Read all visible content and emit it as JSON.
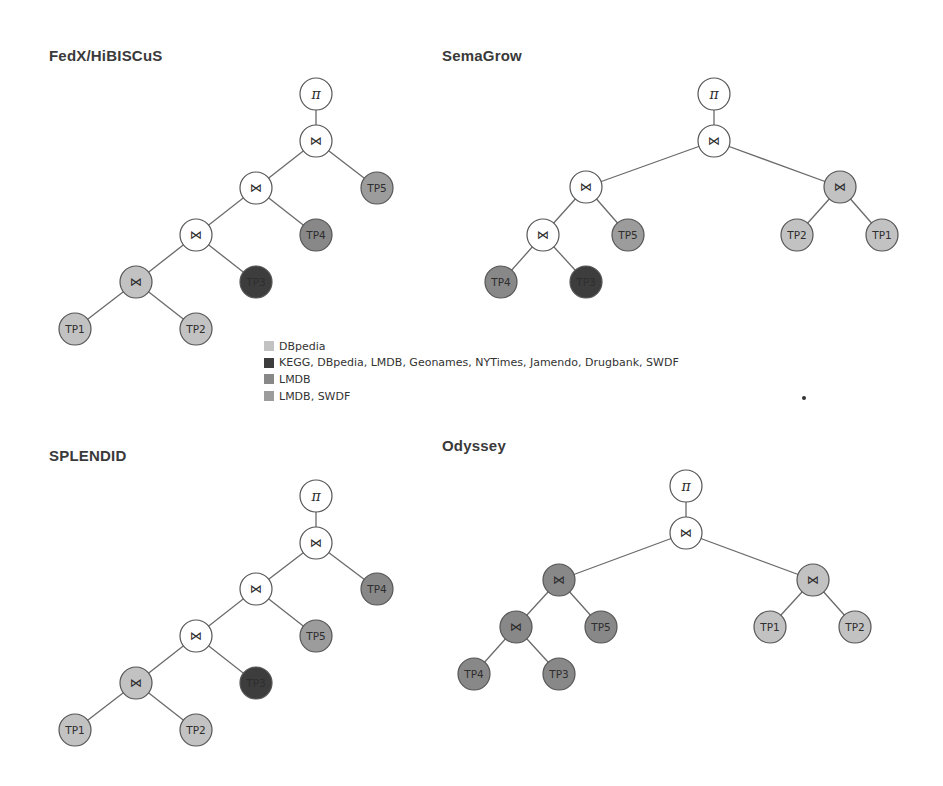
{
  "colors": {
    "dbpedia": "#c2c2c2",
    "all_sources": "#3d3d3d",
    "lmdb": "#888888",
    "lmdb_swdf": "#9c9c9c",
    "operator_white": "#ffffff"
  },
  "node_radius": 16,
  "panels": [
    {
      "id": "fedx",
      "title": "FedX/HiBISCuS",
      "title_pos": [
        49,
        56
      ],
      "nodes": [
        {
          "id": "pi",
          "label": "π",
          "kind": "pi",
          "x": 316,
          "y": 94,
          "color": "operator_white"
        },
        {
          "id": "j1",
          "label": "⋈",
          "kind": "op",
          "x": 316,
          "y": 141,
          "color": "operator_white"
        },
        {
          "id": "j2",
          "label": "⋈",
          "kind": "op",
          "x": 256,
          "y": 188,
          "color": "operator_white"
        },
        {
          "id": "tp5",
          "label": "TP5",
          "kind": "tp",
          "x": 377,
          "y": 188,
          "color": "lmdb_swdf"
        },
        {
          "id": "j3",
          "label": "⋈",
          "kind": "op",
          "x": 196,
          "y": 235,
          "color": "operator_white"
        },
        {
          "id": "tp4",
          "label": "TP4",
          "kind": "tp",
          "x": 316,
          "y": 235,
          "color": "lmdb"
        },
        {
          "id": "j4",
          "label": "⋈",
          "kind": "op",
          "x": 136,
          "y": 282,
          "color": "dbpedia"
        },
        {
          "id": "tp3",
          "label": "TP3",
          "kind": "tp",
          "x": 256,
          "y": 282,
          "color": "all_sources"
        },
        {
          "id": "tp1",
          "label": "TP1",
          "kind": "tp",
          "x": 75,
          "y": 329,
          "color": "dbpedia"
        },
        {
          "id": "tp2",
          "label": "TP2",
          "kind": "tp",
          "x": 196,
          "y": 329,
          "color": "dbpedia"
        }
      ],
      "edges": [
        [
          "pi",
          "j1"
        ],
        [
          "j1",
          "j2"
        ],
        [
          "j1",
          "tp5"
        ],
        [
          "j2",
          "j3"
        ],
        [
          "j2",
          "tp4"
        ],
        [
          "j3",
          "j4"
        ],
        [
          "j3",
          "tp3"
        ],
        [
          "j4",
          "tp1"
        ],
        [
          "j4",
          "tp2"
        ]
      ]
    },
    {
      "id": "semagrow",
      "title": "SemaGrow",
      "title_pos": [
        442,
        56
      ],
      "nodes": [
        {
          "id": "pi",
          "label": "π",
          "kind": "pi",
          "x": 714,
          "y": 94,
          "color": "operator_white"
        },
        {
          "id": "j1",
          "label": "⋈",
          "kind": "op",
          "x": 714,
          "y": 141,
          "color": "operator_white"
        },
        {
          "id": "jl",
          "label": "⋈",
          "kind": "op",
          "x": 586,
          "y": 187,
          "color": "operator_white"
        },
        {
          "id": "jr",
          "label": "⋈",
          "kind": "op",
          "x": 840,
          "y": 187,
          "color": "dbpedia"
        },
        {
          "id": "jll",
          "label": "⋈",
          "kind": "op",
          "x": 543,
          "y": 235,
          "color": "operator_white"
        },
        {
          "id": "tp5",
          "label": "TP5",
          "kind": "tp",
          "x": 628,
          "y": 235,
          "color": "lmdb_swdf"
        },
        {
          "id": "tp2",
          "label": "TP2",
          "kind": "tp",
          "x": 797,
          "y": 235,
          "color": "dbpedia"
        },
        {
          "id": "tp1",
          "label": "TP1",
          "kind": "tp",
          "x": 882,
          "y": 235,
          "color": "dbpedia"
        },
        {
          "id": "tp4",
          "label": "TP4",
          "kind": "tp",
          "x": 501,
          "y": 282,
          "color": "lmdb"
        },
        {
          "id": "tp3",
          "label": "TP3",
          "kind": "tp",
          "x": 586,
          "y": 282,
          "color": "all_sources"
        }
      ],
      "edges": [
        [
          "pi",
          "j1"
        ],
        [
          "j1",
          "jl"
        ],
        [
          "j1",
          "jr"
        ],
        [
          "jl",
          "jll"
        ],
        [
          "jl",
          "tp5"
        ],
        [
          "jr",
          "tp2"
        ],
        [
          "jr",
          "tp1"
        ],
        [
          "jll",
          "tp4"
        ],
        [
          "jll",
          "tp3"
        ]
      ]
    },
    {
      "id": "splendid",
      "title": "SPLENDID",
      "title_pos": [
        49,
        456
      ],
      "nodes": [
        {
          "id": "pi",
          "label": "π",
          "kind": "pi",
          "x": 316,
          "y": 496,
          "color": "operator_white"
        },
        {
          "id": "j1",
          "label": "⋈",
          "kind": "op",
          "x": 316,
          "y": 543,
          "color": "operator_white"
        },
        {
          "id": "j2",
          "label": "⋈",
          "kind": "op",
          "x": 256,
          "y": 589,
          "color": "operator_white"
        },
        {
          "id": "tp4",
          "label": "TP4",
          "kind": "tp",
          "x": 377,
          "y": 589,
          "color": "lmdb"
        },
        {
          "id": "j3",
          "label": "⋈",
          "kind": "op",
          "x": 196,
          "y": 636,
          "color": "operator_white"
        },
        {
          "id": "tp5",
          "label": "TP5",
          "kind": "tp",
          "x": 316,
          "y": 636,
          "color": "lmdb_swdf"
        },
        {
          "id": "j4",
          "label": "⋈",
          "kind": "op",
          "x": 136,
          "y": 683,
          "color": "dbpedia"
        },
        {
          "id": "tp3",
          "label": "TP3",
          "kind": "tp",
          "x": 256,
          "y": 683,
          "color": "all_sources"
        },
        {
          "id": "tp1",
          "label": "TP1",
          "kind": "tp",
          "x": 75,
          "y": 730,
          "color": "dbpedia"
        },
        {
          "id": "tp2",
          "label": "TP2",
          "kind": "tp",
          "x": 196,
          "y": 730,
          "color": "dbpedia"
        }
      ],
      "edges": [
        [
          "pi",
          "j1"
        ],
        [
          "j1",
          "j2"
        ],
        [
          "j1",
          "tp4"
        ],
        [
          "j2",
          "j3"
        ],
        [
          "j2",
          "tp5"
        ],
        [
          "j3",
          "j4"
        ],
        [
          "j3",
          "tp3"
        ],
        [
          "j4",
          "tp1"
        ],
        [
          "j4",
          "tp2"
        ]
      ]
    },
    {
      "id": "odyssey",
      "title": "Odyssey",
      "title_pos": [
        442,
        446
      ],
      "nodes": [
        {
          "id": "pi",
          "label": "π",
          "kind": "pi",
          "x": 686,
          "y": 486,
          "color": "operator_white"
        },
        {
          "id": "j1",
          "label": "⋈",
          "kind": "op",
          "x": 686,
          "y": 533,
          "color": "operator_white"
        },
        {
          "id": "jl",
          "label": "⋈",
          "kind": "op",
          "x": 559,
          "y": 580,
          "color": "lmdb"
        },
        {
          "id": "jr",
          "label": "⋈",
          "kind": "op",
          "x": 813,
          "y": 580,
          "color": "dbpedia"
        },
        {
          "id": "jll",
          "label": "⋈",
          "kind": "op",
          "x": 516,
          "y": 627,
          "color": "lmdb"
        },
        {
          "id": "tp5",
          "label": "TP5",
          "kind": "tp",
          "x": 601,
          "y": 627,
          "color": "lmdb"
        },
        {
          "id": "tp1",
          "label": "TP1",
          "kind": "tp",
          "x": 770,
          "y": 627,
          "color": "dbpedia"
        },
        {
          "id": "tp2",
          "label": "TP2",
          "kind": "tp",
          "x": 855,
          "y": 627,
          "color": "dbpedia"
        },
        {
          "id": "tp4",
          "label": "TP4",
          "kind": "tp",
          "x": 474,
          "y": 674,
          "color": "lmdb"
        },
        {
          "id": "tp3",
          "label": "TP3",
          "kind": "tp",
          "x": 559,
          "y": 674,
          "color": "lmdb"
        }
      ],
      "edges": [
        [
          "pi",
          "j1"
        ],
        [
          "j1",
          "jl"
        ],
        [
          "j1",
          "jr"
        ],
        [
          "jl",
          "jll"
        ],
        [
          "jl",
          "tp5"
        ],
        [
          "jr",
          "tp1"
        ],
        [
          "jr",
          "tp2"
        ],
        [
          "jll",
          "tp4"
        ],
        [
          "jll",
          "tp3"
        ]
      ]
    }
  ],
  "legend": {
    "items": [
      {
        "label": "DBpedia",
        "color": "dbpedia"
      },
      {
        "label": "KEGG, DBpedia, LMDB, Geonames, NYTimes, Jamendo, Drugbank, SWDF",
        "color": "all_sources"
      },
      {
        "label": "LMDB",
        "color": "lmdb"
      },
      {
        "label": "LMDB, SWDF",
        "color": "lmdb_swdf"
      }
    ]
  }
}
